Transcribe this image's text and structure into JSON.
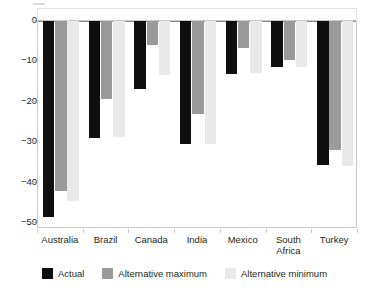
{
  "chart_data": {
    "type": "bar",
    "title": "",
    "subtitle": "",
    "xlabel": "",
    "ylabel": "",
    "ylim": [
      -52,
      2
    ],
    "yticks": [
      0,
      -10,
      -20,
      -30,
      -40,
      -50
    ],
    "ytick_labels": [
      "0",
      "−10",
      "−20",
      "−30",
      "−40",
      "−50"
    ],
    "grid": false,
    "orientation": "vertical",
    "grouped": true,
    "legend_position": "bottom",
    "categories": [
      "Australia",
      "Brazil",
      "Canada",
      "India",
      "Mexico",
      "South\nAfrica",
      "Turkey"
    ],
    "series": [
      {
        "name": "Actual",
        "color": "#100f0f",
        "values": [
          -48.5,
          -29.0,
          -16.8,
          -30.5,
          -13.0,
          -11.5,
          -35.7
        ]
      },
      {
        "name": "Alternative maximum",
        "color": "#9a9a9a",
        "values": [
          -42.0,
          -19.2,
          -6.0,
          -23.0,
          -6.8,
          -9.7,
          -32.0
        ]
      },
      {
        "name": "Alternative minimum",
        "color": "#e9e9e9",
        "values": [
          -44.5,
          -28.8,
          -13.3,
          -30.5,
          -12.8,
          -11.5,
          -35.8
        ]
      }
    ]
  },
  "legend": {
    "items": [
      {
        "label": "Actual",
        "color": "#100f0f"
      },
      {
        "label": "Alternative maximum",
        "color": "#9a9a9a"
      },
      {
        "label": "Alternative minimum",
        "color": "#e9e9e9"
      }
    ]
  },
  "colors": {
    "actual": "#100f0f",
    "alternative_maximum": "#9a9a9a",
    "alternative_minimum": "#e9e9e9",
    "axis": "#c9c9c9",
    "text": "#231f20",
    "background": "#ffffff"
  }
}
